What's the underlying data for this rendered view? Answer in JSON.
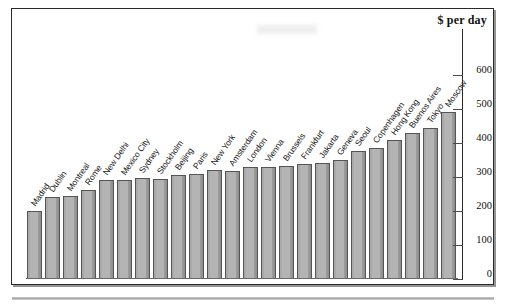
{
  "figure": {
    "axis_title": "$ per day",
    "colors": {
      "bar_fill": "#b4b4b4",
      "bar_edge": "#555555",
      "frame": "#2a2a2a",
      "text": "#111111"
    }
  },
  "chart_data": {
    "type": "bar",
    "title": "$ per day",
    "xlabel": "",
    "ylabel": "$ per day",
    "ylim": [
      0,
      600
    ],
    "yticks": [
      0,
      100,
      200,
      300,
      400,
      500,
      600
    ],
    "ytick_labels": [
      "0",
      "100",
      "200",
      "300",
      "400",
      "500",
      "600"
    ],
    "grid": false,
    "legend": "none",
    "orientation": "vertical",
    "categories": [
      "Madrid",
      "Dublin",
      "Montreal",
      "Rome",
      "New Delhi",
      "Mexico City",
      "Sydney",
      "Stockholm",
      "Beijing",
      "Paris",
      "New York",
      "Amsterdam",
      "London",
      "Vienna",
      "Brussels",
      "Frankfurt",
      "Jakarta",
      "Geneva",
      "Seoul",
      "Copenhagen",
      "Hong Kong",
      "Buenos Aires",
      "Tokyo",
      "Moscow"
    ],
    "values": [
      200,
      240,
      245,
      262,
      292,
      292,
      297,
      295,
      305,
      310,
      320,
      318,
      328,
      328,
      332,
      337,
      342,
      350,
      377,
      385,
      410,
      430,
      445,
      490
    ]
  }
}
